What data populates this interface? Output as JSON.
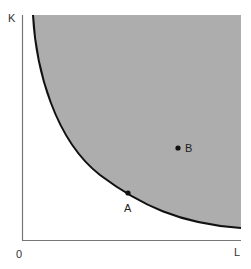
{
  "diagram": {
    "type": "isoquant-feasible-region",
    "axes": {
      "y_label": "K",
      "x_label": "L",
      "origin_label": "0"
    },
    "points": [
      {
        "id": "A",
        "label": "A",
        "x": 128,
        "y": 193,
        "position": "on-curve"
      },
      {
        "id": "B",
        "label": "B",
        "x": 178,
        "y": 148,
        "position": "inside-shaded-region"
      }
    ],
    "curve": {
      "description": "convex curve bounding shaded region",
      "stroke": "#111111"
    },
    "colors": {
      "shaded_region": "#adadad",
      "axis": "#777777",
      "curve": "#111111",
      "point": "#111111",
      "background": "#ffffff"
    }
  }
}
